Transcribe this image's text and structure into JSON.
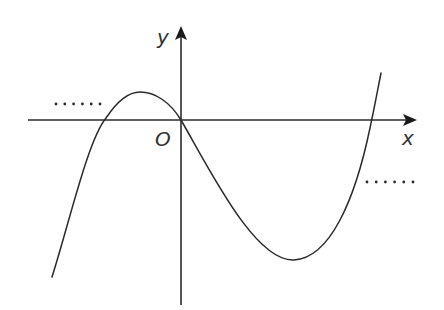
{
  "diagram": {
    "type": "cubic-function-graph",
    "stroke_color": "#2b2b2b",
    "background": "#ffffff",
    "axes": {
      "x_label": "x",
      "y_label": "y",
      "origin_label": "O"
    },
    "curve": {
      "description": "cubic curve rising from lower-left, local maximum left of y-axis, passing through origin, local minimum right of y-axis, rising to upper-right",
      "passes_through_origin": true
    },
    "ellipsis_left": "……",
    "ellipsis_right": "……"
  }
}
